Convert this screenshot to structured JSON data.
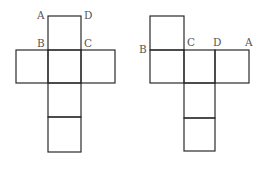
{
  "diagram": {
    "type": "cube nets",
    "colors": {
      "line": "#2a2a2a",
      "label": "#555555",
      "background": "#ffffff"
    },
    "nets": [
      {
        "name": "left-net",
        "shape": "cross",
        "labels": {
          "A": "A",
          "B": "B",
          "C": "C",
          "D": "D"
        }
      },
      {
        "name": "right-net",
        "shape": "offset",
        "labels": {
          "A": "A",
          "B": "B",
          "C": "C",
          "D": "D"
        }
      }
    ]
  }
}
